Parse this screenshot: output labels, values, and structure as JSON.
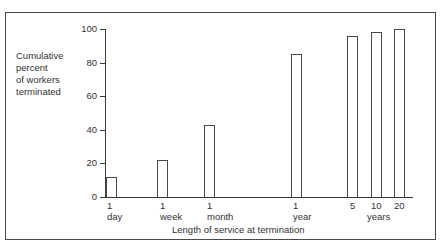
{
  "chart_data": {
    "type": "bar",
    "title": "",
    "xlabel": "Length of service at termination",
    "ylabel": "Cumulative percent of workers terminated",
    "ylabel_lines": [
      "Cumulative",
      "percent",
      "of workers",
      "terminated"
    ],
    "ylim": [
      0,
      100
    ],
    "yticks": [
      0,
      20,
      40,
      60,
      80,
      100
    ],
    "categories": [
      "1 day",
      "1 week",
      "1 month",
      "1 year",
      "5 years",
      "10 years",
      "20 years"
    ],
    "x_tick_labels": [
      {
        "num": "1",
        "unit": "day"
      },
      {
        "num": "1",
        "unit": "week"
      },
      {
        "num": "1",
        "unit": "month"
      },
      {
        "num": "1",
        "unit": "year"
      },
      {
        "num": "5",
        "unit": ""
      },
      {
        "num": "10",
        "unit": "years"
      },
      {
        "num": "20",
        "unit": ""
      }
    ],
    "values": [
      12,
      22,
      43,
      85,
      96,
      98,
      100
    ],
    "grid": false,
    "legend": null
  }
}
